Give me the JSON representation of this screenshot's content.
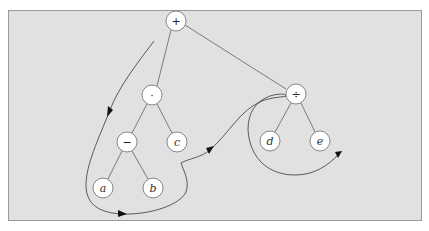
{
  "diagram": {
    "type": "expression-tree-traversal",
    "background_color": "#e1e1e1",
    "nodes": [
      {
        "id": "plus",
        "label": "+",
        "kind": "operator",
        "x": 176,
        "y": 21
      },
      {
        "id": "times",
        "label": "·",
        "kind": "operator",
        "x": 152,
        "y": 95
      },
      {
        "id": "minus",
        "label": "−",
        "kind": "operator",
        "x": 127,
        "y": 142
      },
      {
        "id": "c",
        "label": "c",
        "kind": "operand",
        "x": 177,
        "y": 142
      },
      {
        "id": "a",
        "label": "a",
        "kind": "operand",
        "x": 103,
        "y": 188
      },
      {
        "id": "b",
        "label": "b",
        "kind": "operand",
        "x": 153,
        "y": 188
      },
      {
        "id": "divide",
        "label": "÷",
        "kind": "operator",
        "x": 296,
        "y": 94
      },
      {
        "id": "d",
        "label": "d",
        "kind": "operand",
        "x": 270,
        "y": 141
      },
      {
        "id": "e",
        "label": "e",
        "kind": "operand",
        "x": 320,
        "y": 141
      }
    ],
    "edges": [
      [
        "plus",
        "times"
      ],
      [
        "plus",
        "divide"
      ],
      [
        "times",
        "minus"
      ],
      [
        "times",
        "c"
      ],
      [
        "minus",
        "a"
      ],
      [
        "minus",
        "b"
      ],
      [
        "divide",
        "d"
      ],
      [
        "divide",
        "e"
      ]
    ],
    "traversal_path": "counter-clockwise walk around the tree with arrowheads"
  }
}
